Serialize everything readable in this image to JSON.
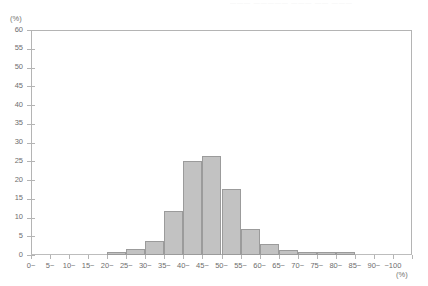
{
  "top_cutoff_text": "―――  ―――――  ―――   ―― ―――",
  "axis": {
    "y_unit": "(%)",
    "x_unit": "(%)"
  },
  "chart_data": {
    "type": "bar",
    "title": "",
    "xlabel": "(%)",
    "ylabel": "(%)",
    "ylim": [
      0,
      60
    ],
    "ytick_step": 5,
    "grid": false,
    "legend": "none",
    "categories": [
      "0~",
      "5~",
      "10~",
      "15~",
      "20~",
      "25~",
      "30~",
      "35~",
      "40~",
      "45~",
      "50~",
      "55~",
      "60~",
      "65~",
      "70~",
      "75~",
      "80~",
      "85~",
      "90~",
      "~100"
    ],
    "yticks": [
      0,
      5,
      10,
      15,
      20,
      25,
      30,
      35,
      40,
      45,
      50,
      55,
      60
    ],
    "values": [
      0.1,
      0.1,
      0.3,
      0.4,
      0.9,
      1.6,
      3.8,
      11.7,
      25.0,
      26.5,
      17.5,
      7.0,
      3.0,
      1.3,
      0.8,
      0.8,
      0.8,
      0.3,
      0.2,
      0.1
    ],
    "bar_fill": "#c2c2c2",
    "bar_border": "#9b9b9b",
    "frame_color": "#b4b4b4"
  }
}
